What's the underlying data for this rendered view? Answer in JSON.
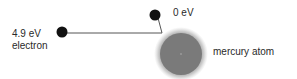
{
  "diagram": {
    "electron": {
      "energy_label": "4.9 eV",
      "name_label": "electron"
    },
    "scattered_electron": {
      "energy_label": "0 eV"
    },
    "atom": {
      "name_label": "mercury atom",
      "color": "#7a7a7a"
    },
    "colors": {
      "electron": "#111111",
      "path": "#555555",
      "text": "#2a2a2a"
    }
  }
}
